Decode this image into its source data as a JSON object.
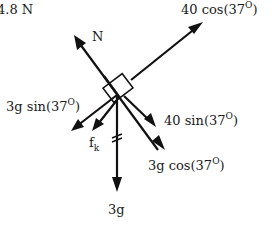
{
  "diagram": {
    "type": "free-body-diagram",
    "colors": {
      "ink": "#111111",
      "background": "#ffffff"
    },
    "top_left_text": "4.8 N",
    "block": {
      "shape": "square",
      "rotation_deg": -37
    },
    "forces": [
      {
        "id": "normal",
        "label": "N",
        "direction": "up-left"
      },
      {
        "id": "applied_parallel",
        "label": "40 cos(37",
        "superscript": "O",
        "suffix": ")",
        "direction": "up-right"
      },
      {
        "id": "applied_perp",
        "label": "40 sin(37",
        "superscript": "O",
        "suffix": ")",
        "direction": "down-right"
      },
      {
        "id": "gravity_parallel",
        "label": "3g sin(37",
        "superscript": "O",
        "suffix": ")",
        "direction": "down-left"
      },
      {
        "id": "friction",
        "label": "f",
        "subscript": "k",
        "direction": "down-left"
      },
      {
        "id": "gravity_perp",
        "label": "3g cos(37",
        "superscript": "O",
        "suffix": ")",
        "direction": "down-right"
      },
      {
        "id": "weight",
        "label": "3g",
        "direction": "down"
      }
    ]
  }
}
